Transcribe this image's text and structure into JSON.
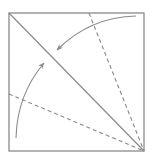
{
  "diagram": {
    "type": "origami-fold-instruction",
    "colors": {
      "background": "#ffffff",
      "paper_edge": "#8a8a8a",
      "crease": "#8a8a8a",
      "valley_fold": "#8a8a8a",
      "arrow": "#8a8a8a"
    },
    "square": {
      "x": 9,
      "y": 13,
      "width": 135,
      "height": 138
    },
    "existing_crease": {
      "from": [
        9,
        13
      ],
      "to": [
        144,
        151
      ],
      "style": "solid"
    },
    "valley_folds": [
      {
        "name": "top-fold-line",
        "from": [
          89,
          13
        ],
        "to": [
          144,
          151
        ],
        "style": "dashed"
      },
      {
        "name": "left-fold-line",
        "from": [
          9,
          94
        ],
        "to": [
          144,
          151
        ],
        "style": "dashed"
      }
    ],
    "arrows": [
      {
        "name": "upper-fold-arrow",
        "from": [
          136,
          16
        ],
        "to": [
          57,
          50
        ],
        "direction": "toward-diagonal"
      },
      {
        "name": "lower-fold-arrow",
        "from": [
          16,
          138
        ],
        "to": [
          44,
          63
        ],
        "direction": "toward-diagonal"
      }
    ]
  }
}
